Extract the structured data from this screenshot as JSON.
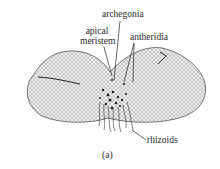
{
  "figure": {
    "caption": "(a)",
    "labels": {
      "archegonia": "archegonia",
      "apical_line1": "apical",
      "apical_line2": "meristem",
      "antheridia": "antheridia",
      "rhizoids": "rhizoids"
    },
    "colors": {
      "ink": "#2a2a2a",
      "tissue_fill": "#e4e4e4",
      "background": "#ffffff"
    }
  }
}
